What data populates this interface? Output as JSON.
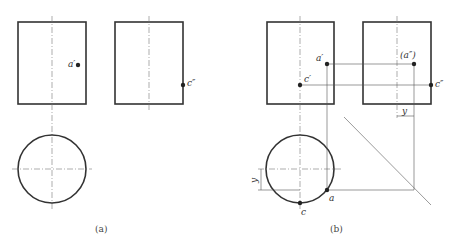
{
  "figure": {
    "panel_a": {
      "caption": "(a)",
      "labels": {
        "a_prime": "a′",
        "c_double_prime": "c″"
      }
    },
    "panel_b": {
      "caption": "(b)",
      "labels": {
        "a_prime": "a′",
        "c_prime": "c′",
        "a_double_prime": "(a″)",
        "c_double_prime": "c″",
        "a": "a",
        "c": "c",
        "y_top": "y",
        "y_left": "y"
      }
    }
  }
}
